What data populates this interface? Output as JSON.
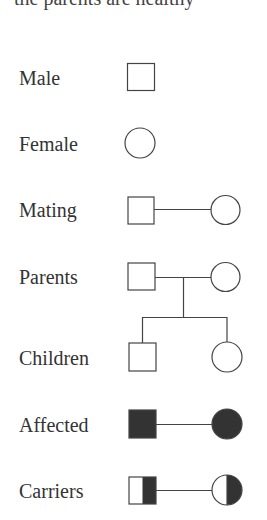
{
  "top_text": "the parents are healthy",
  "colors": {
    "stroke": "#444444",
    "fill": "#333333",
    "background": "#ffffff"
  },
  "legend": [
    {
      "label": "Male",
      "symbol": "square-open"
    },
    {
      "label": "Female",
      "symbol": "circle-open"
    },
    {
      "label": "Mating",
      "symbol": "square-line-circle"
    },
    {
      "label": "Parents",
      "symbol": "square-line-circle-with-descent"
    },
    {
      "label": "Children",
      "symbol": "square-and-circle-siblings"
    },
    {
      "label": "Affected",
      "symbol": "filled-square-line-filled-circle"
    },
    {
      "label": "Carriers",
      "symbol": "half-filled-square-line-half-filled-circle"
    }
  ]
}
